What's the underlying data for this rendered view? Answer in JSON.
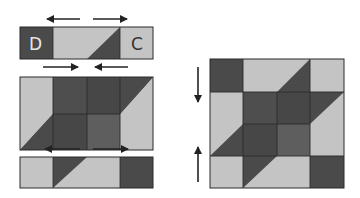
{
  "colors": {
    "dark": "#4a4a4a",
    "mid": "#5e5e5e",
    "light": "#c4c4c4",
    "stroke": "#2a2a2a",
    "arrow": "#222222",
    "label_light": "#e6e6e6",
    "label_dark": "#333333"
  },
  "left_panel": {
    "top_row": {
      "labels": {
        "left": "D",
        "right": "C"
      },
      "arrows": [
        "left",
        "right"
      ]
    },
    "middle_rows": {
      "arrows": [
        "right",
        "left"
      ]
    },
    "bottom_row": {
      "arrows": [
        "left",
        "right"
      ]
    }
  },
  "right_panel": {
    "description": "Assembled 4x4 quilt block",
    "arrows": [
      "down",
      "up"
    ]
  }
}
